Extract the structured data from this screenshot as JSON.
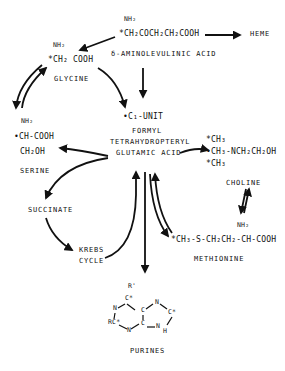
{
  "diagram": {
    "nodes": {
      "ala": {
        "nh2": "NH₂",
        "formula": "*CH₂COCH₂CH₂COOH",
        "name": "δ-AMINOLEVULINIC ACID"
      },
      "heme": {
        "name": "HEME"
      },
      "glycine": {
        "nh2": "NH₂",
        "formula": "*CH₂ COOH",
        "name": "GLYCINE"
      },
      "c1unit": {
        "name": "•C₁-UNIT"
      },
      "formyl": {
        "line1": "FORMYL",
        "line2": "TETRAHYDROPTERYL",
        "line3": "GLUTAMIC ACID"
      },
      "serine": {
        "nh2": "NH₂",
        "formula": "•CH-COOH",
        "sub": "CH₂OH",
        "name": "SERINE"
      },
      "choline": {
        "m1": "*CH₃",
        "m2": "•CH₃-NCH₂CH₂OH",
        "m3": "*CH₃",
        "name": "CHOLINE"
      },
      "succinate": {
        "name": "SUCCINATE"
      },
      "krebs": {
        "line1": "KREBS",
        "line2": "CYCLE"
      },
      "methionine": {
        "nh2": "NH₂",
        "formula": "*CH₃-S-CH₂CH₂-CH-COOH",
        "name": "METHIONINE"
      },
      "purines": {
        "name": "PURINES",
        "atoms": {
          "r1": "R'",
          "c6": "C*",
          "n1": "N",
          "c2": "RC*",
          "n3": "N",
          "c4": "C",
          "c5": "C",
          "n7": "N",
          "c8": "C*",
          "n9": "N",
          "h": "H"
        }
      }
    }
  }
}
